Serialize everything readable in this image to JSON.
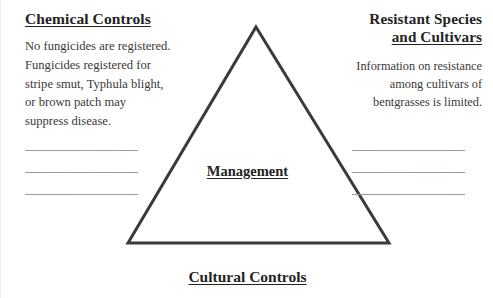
{
  "diagram": {
    "type": "management-triangle",
    "center_label": "Management",
    "bottom_label": "Cultural Controls",
    "stroke_color": "#3a3a38",
    "background_color": "#ffffff",
    "triangle": {
      "apex": [
        255,
        27
      ],
      "bottom_left": [
        127,
        243
      ],
      "bottom_right": [
        388,
        243
      ],
      "stroke_width": 3
    }
  },
  "left_panel": {
    "heading": "Chemical Controls",
    "body_lines": [
      "No fungicides are registered.",
      "Fungicides registered for",
      "stripe smut, Typhula blight,",
      "or brown patch may",
      "suppress disease."
    ]
  },
  "right_panel": {
    "heading_line1": "Resistant Species",
    "heading_line2": "and Cultivars",
    "body_lines": [
      "Information on resistance",
      "among cultivars of",
      "bentgrasses is limited."
    ]
  },
  "note_lines": {
    "left_count": 3,
    "right_count": 3,
    "color": "#9a9a9a"
  }
}
